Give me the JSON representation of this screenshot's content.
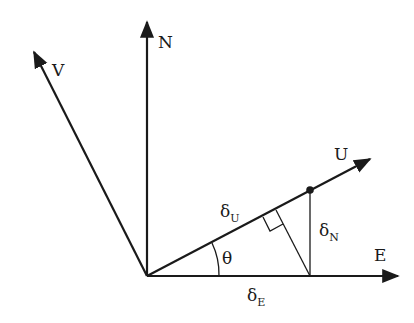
{
  "diagram": {
    "axes": [
      {
        "id": "N",
        "label": "N"
      },
      {
        "id": "E",
        "label": "E"
      },
      {
        "id": "U",
        "label": "U"
      },
      {
        "id": "V",
        "label": "V"
      }
    ],
    "components": {
      "delta_u": {
        "symbol": "δ",
        "subscript": "U"
      },
      "delta_n": {
        "symbol": "δ",
        "subscript": "N"
      },
      "delta_e": {
        "symbol": "δ",
        "subscript": "E"
      }
    },
    "angle": {
      "label": "θ"
    },
    "colors": {
      "stroke": "#1a1a1a",
      "background": "#ffffff"
    }
  }
}
